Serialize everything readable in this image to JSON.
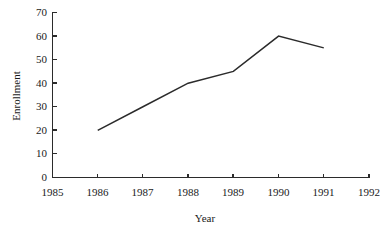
{
  "chart_data": {
    "type": "line",
    "title": "",
    "subtitle": "",
    "xlabel": "Year",
    "ylabel": "Enrollment",
    "x": [
      1986,
      1987,
      1988,
      1989,
      1990,
      1991
    ],
    "values": [
      20,
      30,
      40,
      45,
      60,
      55
    ],
    "series": [
      {
        "name": "Enrollment",
        "x": [
          1986,
          1987,
          1988,
          1989,
          1990,
          1991
        ],
        "values": [
          20,
          30,
          40,
          45,
          60,
          55
        ]
      }
    ],
    "xlim": [
      1985,
      1992
    ],
    "ylim": [
      0,
      70
    ],
    "x_tick_labels": [
      "1985",
      "1986",
      "1987",
      "1988",
      "1989",
      "1990",
      "1991",
      "1992"
    ],
    "y_tick_labels": [
      "0",
      "10",
      "20",
      "30",
      "40",
      "50",
      "60",
      "70"
    ],
    "x_ticks": [
      1985,
      1986,
      1987,
      1988,
      1989,
      1990,
      1991,
      1992
    ],
    "y_ticks": [
      0,
      10,
      20,
      30,
      40,
      50,
      60,
      70
    ],
    "grid": false,
    "legend": false,
    "legend_position": "none",
    "line_color": "#2b2b2b",
    "axis_color": "#2b2b2b",
    "background_color": "#ffffff",
    "annotations": []
  },
  "axes": {
    "y_title": "Enrollment",
    "x_title": "Year"
  },
  "y_tick_labels": {
    "t0": "70",
    "t1": "60",
    "t2": "50",
    "t3": "40",
    "t4": "30",
    "t5": "20",
    "t6": "10",
    "t7": "0"
  },
  "x_tick_labels": {
    "t0": "1985",
    "t1": "1986",
    "t2": "1987",
    "t3": "1988",
    "t4": "1989",
    "t5": "1990",
    "t6": "1991",
    "t7": "1992"
  }
}
